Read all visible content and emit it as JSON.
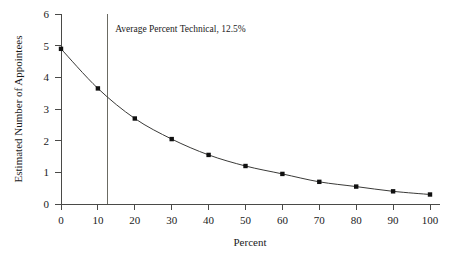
{
  "chart_data": {
    "type": "line",
    "title": "",
    "xlabel": "Percent",
    "ylabel": "Estimated Number of Appointees",
    "xlim": [
      0,
      100
    ],
    "ylim": [
      0,
      6
    ],
    "xticks": [
      0,
      10,
      20,
      30,
      40,
      50,
      60,
      70,
      80,
      90,
      100
    ],
    "xticklabels": [
      "0",
      "10",
      "20",
      "30",
      "40",
      "50",
      "60",
      "70",
      "80",
      "90",
      "100"
    ],
    "yticks": [
      0,
      1,
      2,
      3,
      4,
      5,
      6
    ],
    "yticklabels": [
      "0",
      "1",
      "2",
      "3",
      "4",
      "5",
      "6"
    ],
    "grid": false,
    "legend": "none",
    "x": [
      0,
      10,
      20,
      30,
      40,
      50,
      60,
      70,
      80,
      90,
      100
    ],
    "values": [
      4.9,
      3.65,
      2.7,
      2.05,
      1.55,
      1.2,
      0.95,
      0.7,
      0.55,
      0.4,
      0.3
    ],
    "series": [
      {
        "name": "Estimated Number of Appointees",
        "values": [
          4.9,
          3.65,
          2.7,
          2.05,
          1.55,
          1.2,
          0.95,
          0.7,
          0.55,
          0.4,
          0.3
        ],
        "marker": "square",
        "color": "#101010"
      }
    ],
    "annotations": [
      {
        "type": "vline",
        "x": 12.5,
        "label": "Average Percent Technical, 12.5%",
        "color": "#6b6b63"
      }
    ]
  },
  "axes": {
    "x_title": "Percent",
    "y_title": "Estimated Number of Appointees"
  },
  "annotation": {
    "text": "Average Percent Technical, 12.5%"
  }
}
